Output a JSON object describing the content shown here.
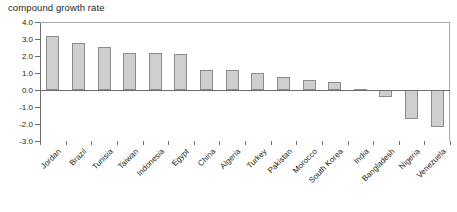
{
  "chart_data": {
    "type": "bar",
    "title": "compound growth rate",
    "xlabel": "",
    "ylabel": "",
    "ylim": [
      -3.0,
      4.0
    ],
    "ytick_labels": [
      "4.0",
      "3.0",
      "2.0",
      "1.0",
      "0.0",
      "-1.0",
      "-2.0",
      "-3.0"
    ],
    "ytick_values": [
      4.0,
      3.0,
      2.0,
      1.0,
      0.0,
      -1.0,
      -2.0,
      -3.0
    ],
    "grid": false,
    "legend": "none",
    "bar_fill_color": "#cfcfcf",
    "bar_border_color": "#8c8c8c",
    "axis_color": "#6d6d6d",
    "categories": [
      "Jordan",
      "Brazil",
      "Tunisia",
      "Taiwan",
      "Indonesia",
      "Egypt",
      "China",
      "Algeria",
      "Turkey",
      "Pakistan",
      "Morocco",
      "South Korea",
      "India",
      "Bangladesh",
      "Nigeria",
      "Venezuela"
    ],
    "values": [
      3.2,
      2.75,
      2.55,
      2.2,
      2.15,
      2.1,
      1.15,
      1.15,
      1.0,
      0.75,
      0.6,
      0.45,
      0.08,
      -0.4,
      -1.7,
      -2.15
    ]
  }
}
